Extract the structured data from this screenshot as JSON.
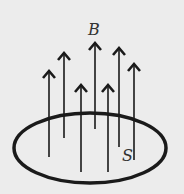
{
  "diagram": {
    "field_label": "B",
    "surface_label": "S",
    "colors": {
      "background": "#ececec",
      "stroke": "#1a1a1a"
    },
    "arrows": [
      {
        "x": 49,
        "top": 71,
        "bottom": 157
      },
      {
        "x": 64,
        "top": 53,
        "bottom": 138
      },
      {
        "x": 81,
        "top": 85,
        "bottom": 172
      },
      {
        "x": 95,
        "top": 43,
        "bottom": 129
      },
      {
        "x": 108,
        "top": 85,
        "bottom": 172
      },
      {
        "x": 119,
        "top": 48,
        "bottom": 147
      },
      {
        "x": 134,
        "top": 64,
        "bottom": 160
      }
    ],
    "surface": {
      "cx": 90,
      "cy": 148,
      "rx": 76,
      "ry": 35
    }
  }
}
